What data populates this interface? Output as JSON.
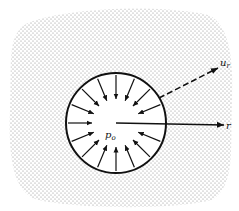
{
  "figure": {
    "type": "pressurized-cavity-diagram",
    "labels": {
      "pressure": "p",
      "pressure_sub": "o",
      "radial_axis": "r",
      "displacement": "u",
      "displacement_sub": "r"
    },
    "circle": {
      "cx": 116,
      "cy": 123,
      "r": 50
    },
    "inward_arrow_count": 16,
    "colors": {
      "ink": "#111111",
      "stipple": "#9a9a9a",
      "background": "#ffffff"
    }
  }
}
